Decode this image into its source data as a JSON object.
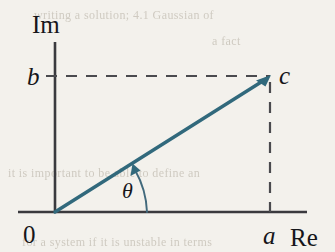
{
  "figure": {
    "type": "argand-diagram",
    "title_text": "",
    "axes": {
      "imaginary_label": "Im",
      "real_label": "Re",
      "origin_label": "0"
    },
    "labels": {
      "imaginary_component": "b",
      "real_component": "a",
      "complex_point": "c",
      "angle": "θ"
    },
    "colors": {
      "background": "#f3f1ec",
      "vector": "#31697c",
      "axis": "#3a3a3e",
      "dashed": "#4a4a4e",
      "text": "#16161a",
      "ghost_text": "#c9c4ba"
    },
    "geometry": {
      "origin": [
        55,
        212
      ],
      "point_c": [
        270,
        76
      ],
      "im_axis_top": [
        55,
        42
      ],
      "re_axis_right": [
        307,
        212
      ],
      "angle_arc_radius": 92,
      "angle_degrees": 32
    },
    "ghost_text": {
      "top": "writing a solution; 4.1 Gaussian of",
      "upper": "a fact",
      "middle": "it is important to be able to define an",
      "bottom": "for a system if it is unstable in terms"
    }
  }
}
